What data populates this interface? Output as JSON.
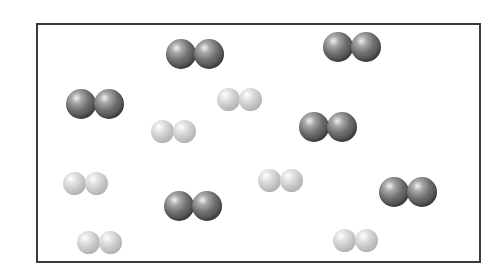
{
  "diagram": {
    "colors": {
      "border": "#3a3a3a",
      "dark_atom": "#5a5a5a",
      "light_atom": "#c4c4c4",
      "background": "#ffffff"
    },
    "container": {
      "x": 36,
      "y": 23,
      "width": 445,
      "height": 240
    },
    "molecules": [
      {
        "type": "dark",
        "x": 166,
        "y": 39
      },
      {
        "type": "dark",
        "x": 323,
        "y": 32
      },
      {
        "type": "dark",
        "x": 66,
        "y": 89
      },
      {
        "type": "light",
        "x": 217,
        "y": 88
      },
      {
        "type": "light",
        "x": 151,
        "y": 120
      },
      {
        "type": "dark",
        "x": 299,
        "y": 112
      },
      {
        "type": "light",
        "x": 63,
        "y": 172
      },
      {
        "type": "light",
        "x": 258,
        "y": 169
      },
      {
        "type": "dark",
        "x": 379,
        "y": 177
      },
      {
        "type": "dark",
        "x": 164,
        "y": 191
      },
      {
        "type": "light",
        "x": 77,
        "y": 231
      },
      {
        "type": "light",
        "x": 333,
        "y": 229
      }
    ],
    "counts": {
      "dark_molecules": 6,
      "light_molecules": 6
    }
  }
}
